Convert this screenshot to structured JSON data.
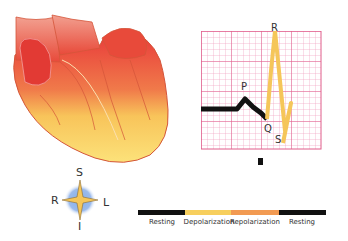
{
  "heart": {
    "name": "heart-illustration"
  },
  "ecg": {
    "labels": {
      "P": "P",
      "Q": "Q",
      "R": "R",
      "S": "S"
    },
    "grid_color": "#e05c8a",
    "resting_color": "#111111",
    "wave_color": "#f5c65a"
  },
  "compass": {
    "S": "S",
    "I": "I",
    "R": "R",
    "L": "L"
  },
  "timeline": {
    "segments": [
      {
        "label": "Resting",
        "color": "#111111"
      },
      {
        "label": "Depolarization",
        "color": "#f7cf5e"
      },
      {
        "label": "Repolarization",
        "color": "#f29a52"
      },
      {
        "label": "Resting",
        "color": "#111111"
      }
    ]
  }
}
